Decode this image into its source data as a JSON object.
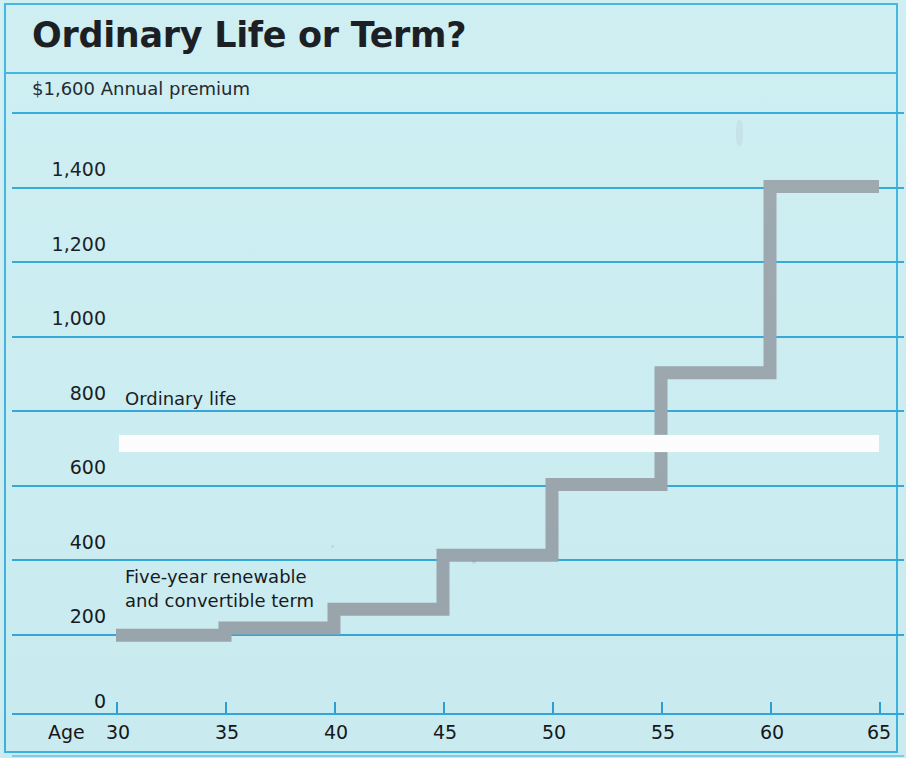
{
  "header": {
    "title": "Ordinary Life or Term?",
    "premium_axis_label": "$1,600 Annual premium"
  },
  "axes": {
    "y_tick_labels": [
      "1,400",
      "1,200",
      "1,000",
      "800",
      "600",
      "400",
      "200",
      "0"
    ],
    "x_axis_prefix": "Age",
    "x_tick_labels": [
      "30",
      "35",
      "40",
      "45",
      "50",
      "55",
      "60",
      "65"
    ]
  },
  "annotations": {
    "ordinary_life": "Ordinary life",
    "term_line1": "Five-year renewable",
    "term_line2": "and convertible term"
  },
  "colors": {
    "background": "#cceef2",
    "gridline": "#31a8da",
    "frame": "#3cb4e0",
    "step_series": "#9aa6ad",
    "ordinary_series": "#ffffff",
    "text": "#14181c"
  },
  "chart_data": {
    "type": "line",
    "title": "Ordinary Life or Term?",
    "subtitle": "",
    "xlabel": "Age",
    "ylabel": "$1,600 Annual premium",
    "xlim": [
      30,
      65
    ],
    "ylim": [
      0,
      1600
    ],
    "ytick_values": [
      0,
      200,
      400,
      600,
      800,
      1000,
      1200,
      1400,
      1600
    ],
    "xtick_values": [
      30,
      35,
      40,
      45,
      50,
      55,
      60,
      65
    ],
    "grid": true,
    "legend": "inline-annotations",
    "series": [
      {
        "name": "Ordinary life",
        "style": "flat-white-band",
        "x": [
          30,
          65
        ],
        "values": [
          710,
          710
        ]
      },
      {
        "name": "Five-year renewable and convertible term",
        "style": "gray-staircase",
        "steps": [
          {
            "age_from": 30,
            "age_to": 35,
            "premium": 195
          },
          {
            "age_from": 35,
            "age_to": 40,
            "premium": 215
          },
          {
            "age_from": 40,
            "age_to": 45,
            "premium": 265
          },
          {
            "age_from": 45,
            "age_to": 50,
            "premium": 410
          },
          {
            "age_from": 50,
            "age_to": 55,
            "premium": 600
          },
          {
            "age_from": 55,
            "age_to": 60,
            "premium": 900
          },
          {
            "age_from": 60,
            "age_to": 65,
            "premium": 1400
          }
        ]
      }
    ]
  },
  "layout": {
    "gridline_tops": [
      2,
      77,
      151,
      226,
      300,
      375,
      449,
      524,
      598
    ],
    "gridline_values": [
      1600,
      1400,
      1200,
      1000,
      800,
      600,
      400,
      200,
      0
    ],
    "ytick_label_tops": [
      48,
      123,
      197,
      272,
      346,
      421,
      495,
      580
    ],
    "xtick_lefts": [
      110,
      219,
      328,
      437,
      546,
      655,
      764,
      873
    ]
  }
}
